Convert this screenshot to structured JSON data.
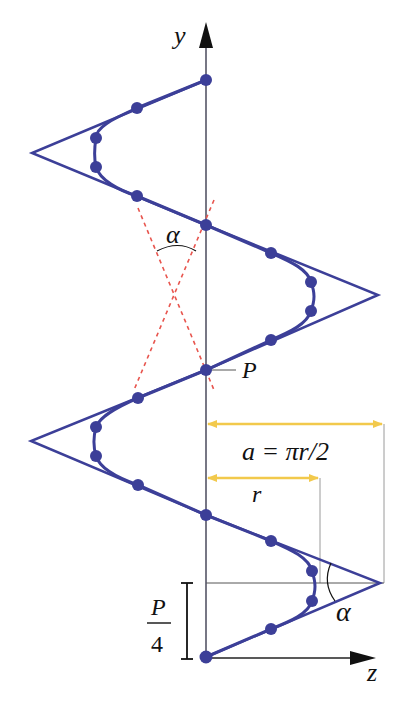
{
  "diagram": {
    "title": "",
    "colors": {
      "helix": "#3c3f98",
      "axis": "#555566",
      "dashed": "#e8554e",
      "arrow_dim": "#f2c94c",
      "guide": "#9a9a9a",
      "text": "#111111"
    },
    "labels": {
      "y_axis": "y",
      "z_axis": "z",
      "alpha_top": "α",
      "alpha_bottom": "α",
      "pitch_point": "P",
      "a_formula": "a = πr/2",
      "r_label": "r",
      "fraction_num": "P",
      "fraction_den": "4"
    }
  }
}
